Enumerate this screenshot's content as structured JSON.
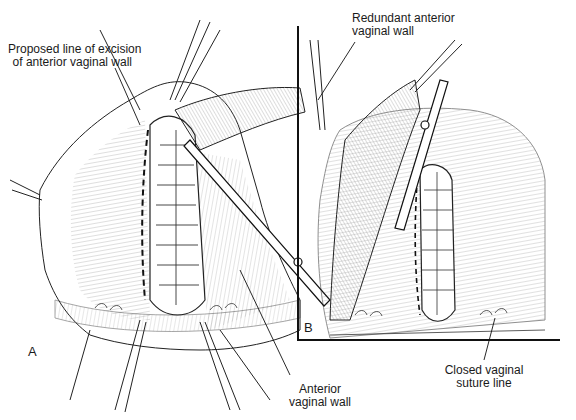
{
  "figure": {
    "panels": [
      {
        "id": "A",
        "letter": "A"
      },
      {
        "id": "B",
        "letter": "B"
      }
    ],
    "labels": {
      "proposed_line_1": "Proposed line of excision",
      "proposed_line_2": "of anterior vaginal wall",
      "redundant_1": "Redundant anterior",
      "redundant_2": "vaginal wall",
      "anterior_1": "Anterior",
      "anterior_2": "vaginal wall",
      "closed_1": "Closed vaginal",
      "closed_2": "suture line"
    },
    "colors": {
      "ink": "#1a1a1a",
      "background": "#ffffff"
    }
  }
}
